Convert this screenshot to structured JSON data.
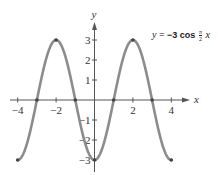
{
  "chart_data": {
    "type": "line",
    "title": "",
    "equation": {
      "lhs": "y",
      "equals": "=",
      "coef": "−3",
      "func": "cos",
      "frac_num": "π",
      "frac_den": "2",
      "var": "x"
    },
    "xlabel": "x",
    "ylabel": "y",
    "xlim": [
      -4.5,
      5
    ],
    "ylim": [
      -3.5,
      4
    ],
    "x_ticks": [
      -4,
      -3,
      -2,
      -1,
      0,
      1,
      2,
      3,
      4
    ],
    "x_tick_labels": [
      "−4",
      "−2",
      "2",
      "4"
    ],
    "x_tick_label_values": [
      -4,
      -2,
      2,
      4
    ],
    "y_ticks": [
      -3,
      -2,
      -1,
      1,
      2,
      3
    ],
    "y_tick_labels": [
      "3",
      "2",
      "1",
      "−1",
      "−2",
      "−3"
    ],
    "y_tick_label_values": [
      3,
      2,
      1,
      -1,
      -2,
      -3
    ],
    "grid": false,
    "series": [
      {
        "name": "y = -3 cos(πx/2)",
        "function": "-3*cos(pi*x/2)",
        "domain": [
          -4,
          4
        ],
        "color": "#8c8c8c",
        "marked_points": [
          {
            "x": -4,
            "y": -3
          },
          {
            "x": -3,
            "y": 0
          },
          {
            "x": -2,
            "y": 3
          },
          {
            "x": -1,
            "y": 0
          },
          {
            "x": 0,
            "y": -3
          },
          {
            "x": 1,
            "y": 0
          },
          {
            "x": 2,
            "y": 3
          },
          {
            "x": 3,
            "y": 0
          },
          {
            "x": 4,
            "y": -3
          }
        ]
      }
    ]
  },
  "colors": {
    "curve": "#8c8c8c",
    "axis": "#555555",
    "point": "#444444"
  }
}
